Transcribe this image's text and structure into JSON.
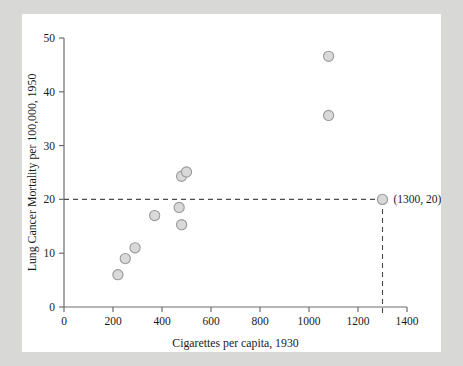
{
  "figure": {
    "background_color": "#ffffff",
    "page_background_color": "#d8d8d6",
    "marker_fill": "#d9d9d9",
    "marker_stroke": "#9a9a9a",
    "guide_color": "#4a4a4a"
  },
  "chart_data": {
    "type": "scatter",
    "title": "",
    "xlabel": "Cigarettes per capita, 1930",
    "ylabel": "Lung Cancer Mortality per 100,000, 1950",
    "xlim": [
      0,
      1400
    ],
    "ylim": [
      0,
      50
    ],
    "xticks": [
      0,
      200,
      400,
      600,
      800,
      1000,
      1200,
      1400
    ],
    "yticks": [
      0,
      10,
      20,
      30,
      40,
      50
    ],
    "xtick_labels": [
      "0",
      "200",
      "400",
      "600",
      "800",
      "1000",
      "1200",
      "1400"
    ],
    "ytick_labels": [
      "0",
      "10",
      "20",
      "30",
      "40",
      "50"
    ],
    "grid": false,
    "legend": null,
    "points": [
      {
        "x": 220,
        "y": 6.0
      },
      {
        "x": 250,
        "y": 9.0
      },
      {
        "x": 290,
        "y": 11.0
      },
      {
        "x": 370,
        "y": 17.0
      },
      {
        "x": 470,
        "y": 18.5
      },
      {
        "x": 480,
        "y": 15.3
      },
      {
        "x": 480,
        "y": 24.3
      },
      {
        "x": 500,
        "y": 25.1
      },
      {
        "x": 1080,
        "y": 46.6
      },
      {
        "x": 1080,
        "y": 35.6
      }
    ],
    "highlight_point": {
      "x": 1300,
      "y": 20,
      "label": "(1300, 20)"
    },
    "guides": [
      {
        "type": "horizontal",
        "y": 20,
        "from_x": 0,
        "to_x": 1300,
        "style": "dashed"
      },
      {
        "type": "vertical",
        "x": 1300,
        "from_y": 0,
        "to_y": 20,
        "style": "dashed"
      }
    ]
  }
}
